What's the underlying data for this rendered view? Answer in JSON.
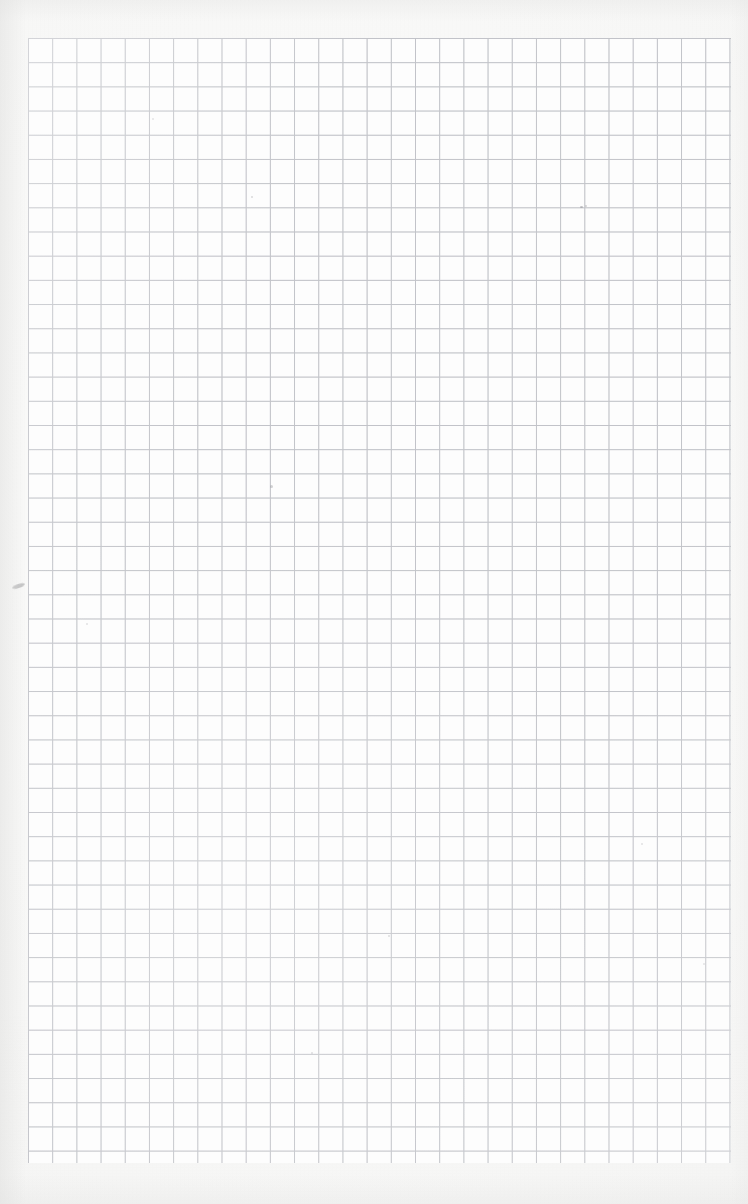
{
  "document": {
    "kind": "scanned-graph-paper",
    "title": "Blank quadrille / graph paper sheet",
    "visible_text": "",
    "page_width": 748,
    "page_height": 1204
  },
  "paper": {
    "margin_color": "#f7f7f6",
    "sheet_color": "#fdfdfd",
    "edge_shadow_color": "#e4e4e3"
  },
  "grid": {
    "line_color": "#c9cace",
    "line_color_soft": "#b9bbc2",
    "cell_size_px": 24.2,
    "line_width_px": 1,
    "columns": 29,
    "rows": 46,
    "left_px": 28,
    "top_px": 38,
    "right_px": 731,
    "bottom_px": 1163,
    "width_px": 703,
    "height_px": 1125,
    "uniform_weight": true,
    "has_major_lines": false
  },
  "marks": [
    {
      "name": "pencil-smudge-left-margin",
      "x": 12,
      "y": 584,
      "w": 13,
      "h": 4,
      "color": "rgba(150,150,152,0.55)",
      "rotate": -18
    },
    {
      "name": "speck-upper-right",
      "x": 580,
      "y": 206,
      "w": 3,
      "h": 2,
      "color": "rgba(140,140,145,0.50)"
    },
    {
      "name": "speck-mid-left",
      "x": 270,
      "y": 485,
      "w": 3,
      "h": 3,
      "color": "rgba(150,150,154,0.42)"
    },
    {
      "name": "speck-upper-mid",
      "x": 251,
      "y": 196,
      "w": 2,
      "h": 2,
      "color": "rgba(158,158,162,0.38)"
    },
    {
      "name": "speck-right-upper",
      "x": 585,
      "y": 205,
      "w": 2,
      "h": 2,
      "color": "rgba(150,150,155,0.40)"
    },
    {
      "name": "speck-center",
      "x": 388,
      "y": 935,
      "w": 2,
      "h": 2,
      "color": "rgba(160,160,164,0.34)"
    },
    {
      "name": "speck-lower-mid",
      "x": 311,
      "y": 1052,
      "w": 2,
      "h": 2,
      "color": "rgba(158,158,162,0.32)"
    },
    {
      "name": "speck-left-mid",
      "x": 86,
      "y": 623,
      "w": 2,
      "h": 2,
      "color": "rgba(162,162,166,0.30)"
    },
    {
      "name": "speck-right-mid",
      "x": 641,
      "y": 843,
      "w": 2,
      "h": 2,
      "color": "rgba(160,160,165,0.30)"
    },
    {
      "name": "speck-top-left",
      "x": 152,
      "y": 118,
      "w": 2,
      "h": 2,
      "color": "rgba(164,164,168,0.28)"
    },
    {
      "name": "speck-bottom-right",
      "x": 703,
      "y": 963,
      "w": 2,
      "h": 2,
      "color": "rgba(160,160,164,0.28)"
    }
  ]
}
